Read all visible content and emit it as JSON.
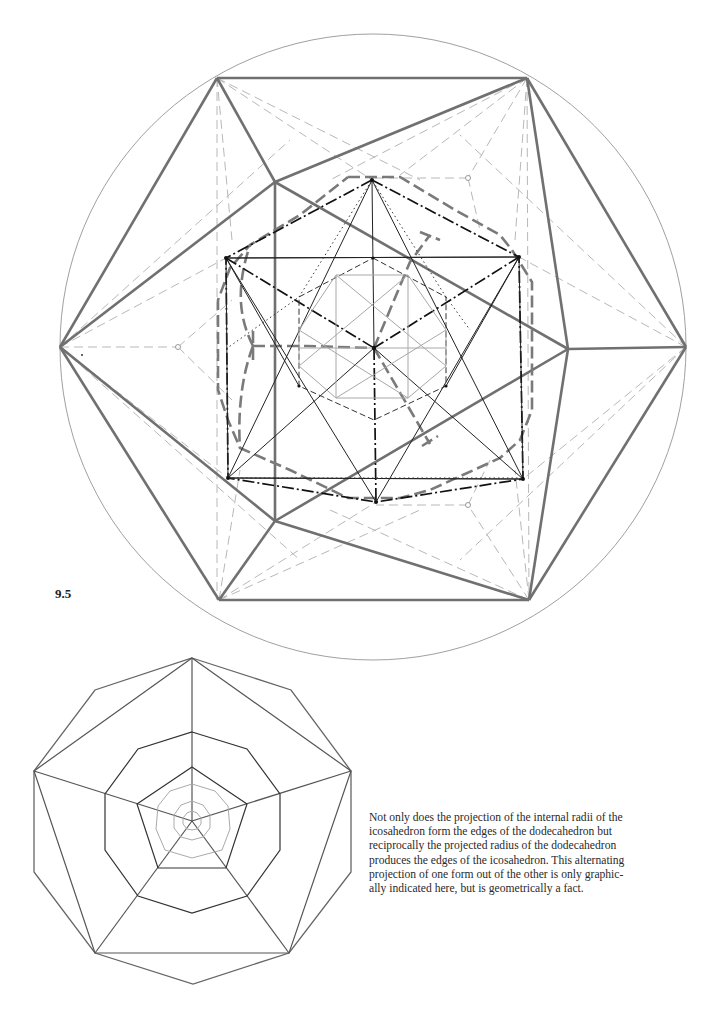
{
  "figure": {
    "label": "9.5",
    "main_diagram": {
      "description": "Reciprocal projection of icosahedron and dodecahedron within a circumscribed circle",
      "colors": {
        "outer_edges": "#6e6e6e",
        "inner_edges": "#1a1a1a",
        "dashed_light": "#b0b0b0",
        "circle": "#9a9a9a"
      }
    },
    "bottom_diagram": {
      "description": "Nested decagons and pentagons projection of dodecahedron"
    }
  },
  "caption": {
    "lines": [
      "Not only does the projection of the internal radii of the",
      "icosahedron form the edges of the dodecahedron but",
      "reciprocally the projected radius of the dodecahedron",
      "produces the edges of the icosahedron. This alternating",
      "projection of one form out of the other is only graphic-",
      "ally indicated here, but is geometrically a fact."
    ]
  }
}
